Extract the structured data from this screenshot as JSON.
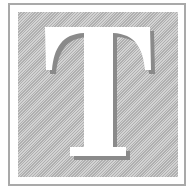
{
  "glyph": {
    "letter": "T",
    "description": "Serif capital letter T on a hatched gray square inside a framed border",
    "colors": {
      "frame": "#a9a9a9",
      "hatch_dark": "#b0b0b0",
      "hatch_light": "#d2d2d2",
      "letter_fill": "#ffffff",
      "letter_shadow": "#8a8a8a"
    }
  }
}
